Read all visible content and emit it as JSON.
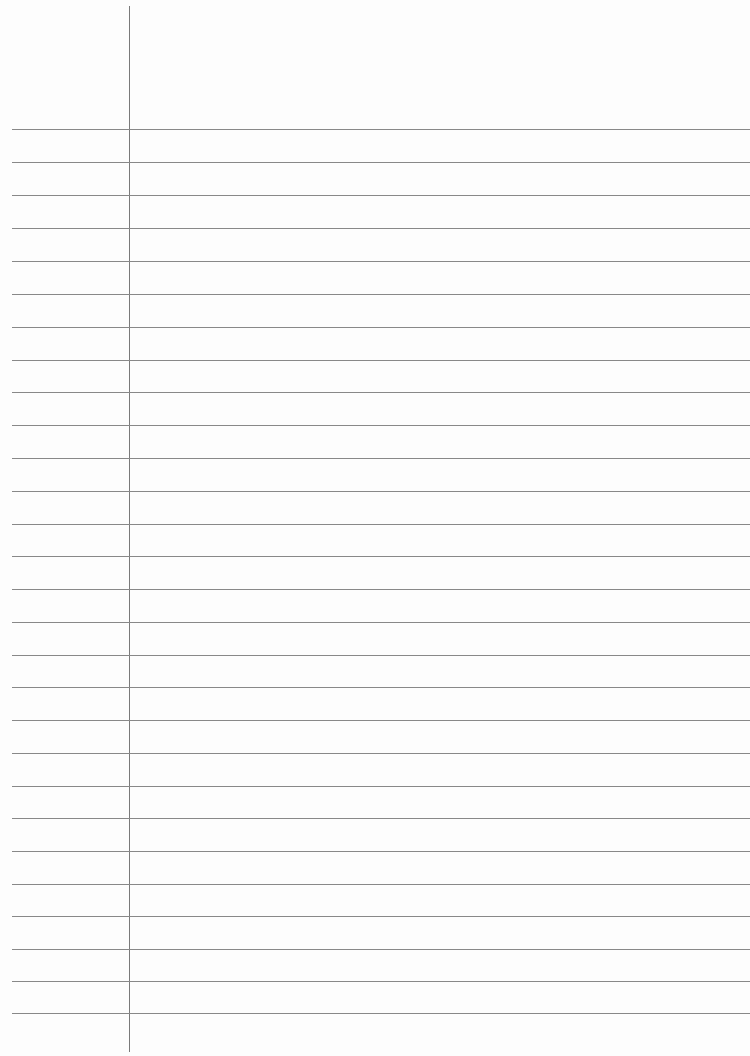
{
  "page": {
    "type": "lined-paper",
    "background_color": "#fdfdfd",
    "line_color": "#888888",
    "margin_line_color": "#7a7a7a",
    "margin_line_x": 129,
    "rules_y": [
      129,
      162,
      195,
      228,
      261,
      294,
      327,
      360,
      392,
      425,
      458,
      491,
      524,
      556,
      589,
      622,
      655,
      687,
      720,
      753,
      786,
      818,
      851,
      884,
      916,
      949,
      981,
      1013
    ]
  }
}
